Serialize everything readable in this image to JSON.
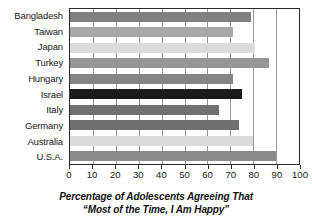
{
  "chart_data": {
    "type": "bar",
    "orientation": "horizontal",
    "title": "",
    "axis_title_lines": [
      "Percentage of Adolescents Agreeing That",
      "“Most of the Time, I Am Happy”"
    ],
    "xlabel": "Percentage of Adolescents Agreeing That “Most of the Time, I Am Happy”",
    "ylabel": "",
    "xlim": [
      0,
      100
    ],
    "xticks": [
      0,
      10,
      20,
      30,
      40,
      50,
      60,
      70,
      80,
      90,
      100
    ],
    "xtick_labels": [
      "0",
      "10",
      "20",
      "30",
      "40",
      "50",
      "60",
      "70",
      "80",
      "90",
      "100"
    ],
    "grid": true,
    "grid_axis": "x",
    "legend": false,
    "legend_position": "none",
    "categories": [
      "Bangladesh",
      "Taiwan",
      "Japan",
      "Turkey",
      "Hungary",
      "Israel",
      "Italy",
      "Germany",
      "Australia",
      "U.S.A."
    ],
    "values": [
      79,
      71,
      81,
      87,
      71,
      75,
      65,
      74,
      80,
      90
    ],
    "bar_colors": [
      "#808080",
      "#a9a9a9",
      "#dcdcdc",
      "#969696",
      "#848484",
      "#1a1a1a",
      "#707070",
      "#6f6f6f",
      "#dcdcdc",
      "#8c8c8c"
    ],
    "series": [
      {
        "name": "Percentage agreeing",
        "values": [
          79,
          71,
          81,
          87,
          71,
          75,
          65,
          74,
          80,
          90
        ]
      }
    ],
    "points": [
      {
        "category": "Bangladesh",
        "value": 79,
        "color": "#808080"
      },
      {
        "category": "Taiwan",
        "value": 71,
        "color": "#a9a9a9"
      },
      {
        "category": "Japan",
        "value": 81,
        "color": "#dcdcdc"
      },
      {
        "category": "Turkey",
        "value": 87,
        "color": "#969696"
      },
      {
        "category": "Hungary",
        "value": 71,
        "color": "#848484"
      },
      {
        "category": "Israel",
        "value": 75,
        "color": "#1a1a1a"
      },
      {
        "category": "Italy",
        "value": 65,
        "color": "#707070"
      },
      {
        "category": "Germany",
        "value": 74,
        "color": "#6f6f6f"
      },
      {
        "category": "Australia",
        "value": 80,
        "color": "#dcdcdc"
      },
      {
        "category": "U.S.A.",
        "value": 90,
        "color": "#8c8c8c"
      }
    ],
    "colors": {
      "plot_border": "#2b2b2b",
      "gridline": "#9a9a9a",
      "text": "#1a1a1a",
      "background": "#ffffff"
    }
  }
}
